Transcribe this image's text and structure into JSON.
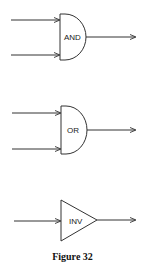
{
  "diagram": {
    "caption": "Figure 32",
    "stroke_color": "#333333",
    "gates": [
      {
        "type": "AND",
        "label": "AND",
        "inputs": 2,
        "outputs": 1
      },
      {
        "type": "OR",
        "label": "OR",
        "inputs": 2,
        "outputs": 1
      },
      {
        "type": "INV",
        "label": "INV",
        "inputs": 1,
        "outputs": 1
      }
    ]
  }
}
